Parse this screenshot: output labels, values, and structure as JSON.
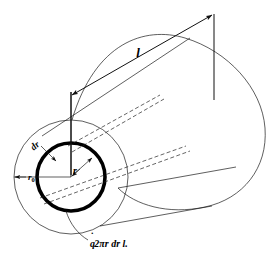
{
  "figure": {
    "background_color": "#ffffff",
    "line_color": "#1a1a1a",
    "ring_color": "#000000"
  },
  "labels": {
    "length": "l",
    "radius": "r",
    "outer_radius": "r",
    "outer_radius_subscript": "0",
    "thickness": "dr",
    "caption_q": "q",
    "caption_rest": "2πr dr l."
  },
  "annotations": {
    "length_dimension_name": "length-dimension-l",
    "radius_dimension_name": "radius-dimension-r",
    "outer_radius_dimension_name": "outer-radius-dimension-r0",
    "thickness_leader_name": "thickness-leader-dr",
    "caption_leader_name": "caption-leader-line"
  },
  "geometry": {
    "near_face_center_x": 71,
    "near_face_center_y": 177,
    "outer_circle_radius": 57,
    "ring_radius": 34,
    "ring_stroke_width": 3.6
  }
}
